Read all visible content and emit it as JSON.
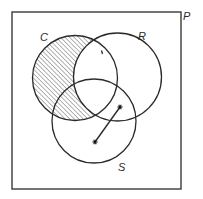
{
  "diagram": {
    "type": "venn",
    "universe": {
      "label": "P",
      "box": {
        "x": 12,
        "y": 12,
        "width": 169,
        "height": 177
      },
      "label_pos": {
        "x": 183,
        "y": 20
      }
    },
    "sets": [
      {
        "id": "C",
        "label": "C",
        "cx": 75,
        "cy": 78,
        "r": 42.5,
        "label_pos": {
          "x": 40,
          "y": 41
        }
      },
      {
        "id": "R",
        "label": "R",
        "cx": 117.5,
        "cy": 77,
        "r": 44,
        "label_pos": {
          "x": 138,
          "y": 40
        }
      },
      {
        "id": "S",
        "label": "S",
        "cx": 94,
        "cy": 121,
        "r": 42,
        "label_pos": {
          "x": 118,
          "y": 171
        }
      }
    ],
    "shaded_region": {
      "description": "C minus R (hatched)",
      "expression": "C \\ R",
      "pattern": "diagonal-hatch"
    },
    "points": [
      {
        "symbol": "*",
        "x": 120,
        "y": 107
      },
      {
        "symbol": "*",
        "x": 95,
        "y": 142
      }
    ],
    "connector": {
      "from": 0,
      "to": 1
    },
    "tick_mark": {
      "x": 102,
      "y": 52
    }
  }
}
